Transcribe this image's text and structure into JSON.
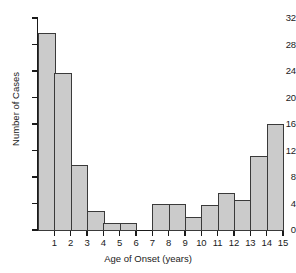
{
  "chart_data": {
    "type": "bar",
    "title": "",
    "subtitle": "",
    "xlabel": "Age of Onset (years)",
    "ylabel": "Number of Cases",
    "xlim": [
      0,
      15
    ],
    "ylim": [
      0,
      32
    ],
    "grid": false,
    "legend": null,
    "bin_width": 1,
    "x_tick_labels": [
      "1",
      "2",
      "3",
      "4",
      "5",
      "6",
      "7",
      "8",
      "9",
      "10",
      "11",
      "12",
      "13",
      "14",
      "15"
    ],
    "x_tick_values": [
      1,
      2,
      3,
      4,
      5,
      6,
      7,
      8,
      9,
      10,
      11,
      12,
      13,
      14,
      15
    ],
    "y_tick_labels": [
      "0",
      "4",
      "8",
      "12",
      "16",
      "20",
      "24",
      "28",
      "32"
    ],
    "y_tick_values": [
      0,
      4,
      8,
      12,
      16,
      20,
      24,
      28,
      32
    ],
    "categories": [
      "0-1",
      "1-2",
      "2-3",
      "3-4",
      "4-5",
      "5-6",
      "6-7",
      "7-8",
      "8-9",
      "9-10",
      "10-11",
      "11-12",
      "12-13",
      "13-14",
      "14-15"
    ],
    "bin_starts": [
      0,
      1,
      2,
      3,
      4,
      5,
      6,
      7,
      8,
      9,
      10,
      11,
      12,
      13,
      14
    ],
    "values": [
      29.8,
      23.7,
      9.8,
      2.8,
      1,
      1,
      0,
      4,
      4,
      2,
      3.8,
      5.6,
      4.5,
      11.2,
      16
    ],
    "colors": {
      "bar_fill": "#cbcbcb",
      "bar_border": "#3a3a3a",
      "axis": "#1a1a1a",
      "text": "#1a1a1a",
      "background": "#ffffff"
    }
  }
}
